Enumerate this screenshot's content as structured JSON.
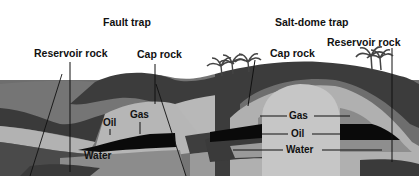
{
  "diagram": {
    "titles": {
      "fault_trap": "Fault trap",
      "salt_dome_trap": "Salt-dome trap"
    },
    "fault_trap_labels": {
      "reservoir_rock": "Reservoir rock",
      "cap_rock": "Cap rock",
      "gas": "Gas",
      "oil": "Oil",
      "water": "Water"
    },
    "salt_dome_labels": {
      "cap_rock": "Cap rock",
      "reservoir_rock": "Reservoir rock",
      "gas": "Gas",
      "oil": "Oil",
      "water": "Water"
    },
    "colors": {
      "sky": "#ffffff",
      "dark_layer": "#3a3a3a",
      "mid_layer": "#707070",
      "light_layer": "#b4b4b4",
      "salt_dome": "#c2c2c2",
      "gas_zone": "#8a8a8a",
      "oil_zone": "#0a0a0a",
      "water_zone": "#9a9a9a",
      "text": "#111111"
    }
  }
}
